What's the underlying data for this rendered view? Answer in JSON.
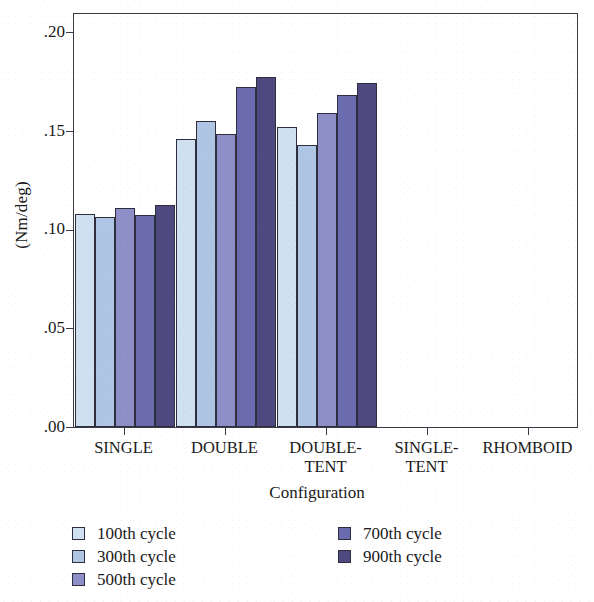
{
  "chart_data": {
    "type": "bar",
    "title": "",
    "xlabel": "Configuration",
    "ylabel": "(Nm/deg)",
    "ylim": [
      0.0,
      0.21
    ],
    "grid": false,
    "legend_position": "bottom",
    "ytick_labels": [
      ".20",
      ".15",
      ".10",
      ".05",
      ".00"
    ],
    "ytick_values": [
      0.2,
      0.15,
      0.1,
      0.05,
      0.0
    ],
    "categories": [
      "SINGLE",
      "DOUBLE",
      "DOUBLE-TENT",
      "SINGLE-TENT",
      "RHOMBOID"
    ],
    "category_lines": [
      {
        "l1": "SINGLE",
        "l2": ""
      },
      {
        "l1": "DOUBLE",
        "l2": ""
      },
      {
        "l1": "DOUBLE-",
        "l2": "TENT"
      },
      {
        "l1": "SINGLE-",
        "l2": "TENT"
      },
      {
        "l1": "RHOMBOID",
        "l2": ""
      }
    ],
    "series": [
      {
        "name": "100th cycle",
        "color": "#cfe0f0",
        "values": [
          0.108,
          0.1455,
          0.152,
          0.0,
          0.0
        ]
      },
      {
        "name": "300th cycle",
        "color": "#aec6e4",
        "values": [
          0.1065,
          0.155,
          0.1425,
          0.0,
          0.0
        ]
      },
      {
        "name": "500th cycle",
        "color": "#8f8fc8",
        "values": [
          0.111,
          0.1485,
          0.159,
          0.0,
          0.0
        ]
      },
      {
        "name": "700th cycle",
        "color": "#6b6bb0",
        "values": [
          0.1075,
          0.172,
          0.168,
          0.0,
          0.0
        ]
      },
      {
        "name": "900th cycle",
        "color": "#4e4a80",
        "values": [
          0.1125,
          0.177,
          0.174,
          0.0,
          0.0
        ]
      }
    ]
  },
  "axis": {
    "ylabel": "(Nm/deg)",
    "xlabel": "Configuration"
  },
  "legend": {
    "column1": [
      {
        "label": "100th cycle",
        "color": "#cfe0f0"
      },
      {
        "label": "300th cycle",
        "color": "#aec6e4"
      },
      {
        "label": "500th cycle",
        "color": "#8f8fc8"
      }
    ],
    "column2": [
      {
        "label": "700th cycle",
        "color": "#6b6bb0"
      },
      {
        "label": "900th cycle",
        "color": "#4e4a80"
      }
    ]
  }
}
